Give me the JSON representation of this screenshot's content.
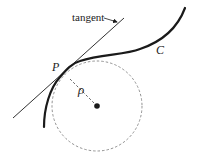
{
  "diagram": {
    "labels": {
      "tangent": "tangent",
      "curve": "C",
      "point": "P",
      "radius": "ρ"
    },
    "colors": {
      "stroke": "#1a1a1a",
      "dashed": "#777777",
      "background": "#ffffff"
    },
    "elements": [
      "tangent line",
      "curve C",
      "point P",
      "osculating circle (dashed)",
      "radius of curvature ρ",
      "circle center"
    ]
  }
}
